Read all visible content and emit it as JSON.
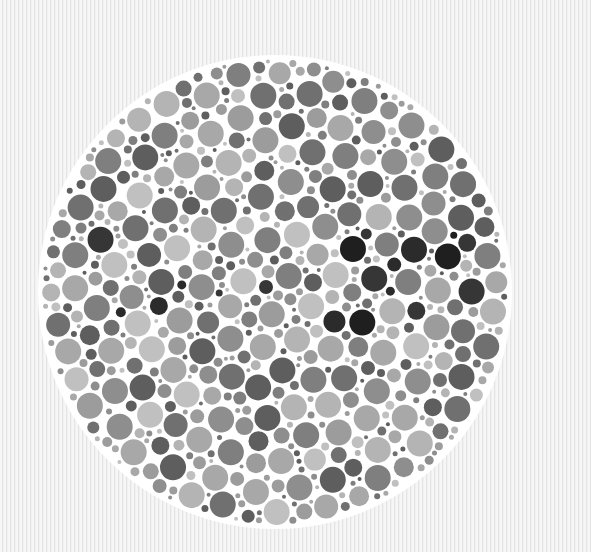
{
  "image": {
    "width": 591,
    "height": 552,
    "description": "Grayscale Ishihara-style dot plate"
  },
  "background": {
    "base_color": "#f3f3f3",
    "stripe_colors": [
      "#f6f6f6",
      "#e4e4e4",
      "#f1f1f1"
    ],
    "stripe_orientation": "vertical"
  },
  "plate": {
    "center_x": 275,
    "center_y": 292,
    "radius": 233,
    "fill_color": "#ffffff",
    "dot_radius_min": 2,
    "dot_radius_max": 13,
    "gray_palette": [
      "#5e5e5e",
      "#707070",
      "#7f7f7f",
      "#8e8e8e",
      "#9c9c9c",
      "#a8a8a8",
      "#b4b4b4",
      "#c0c0c0"
    ],
    "dark_palette": [
      "#1f1f1f",
      "#2b2b2b",
      "#363636"
    ],
    "dark_band": {
      "y_start": 222,
      "y_end": 325,
      "dark_probability": 0.18
    },
    "scatter_dark_probability": 0.06,
    "seed": 1337
  }
}
